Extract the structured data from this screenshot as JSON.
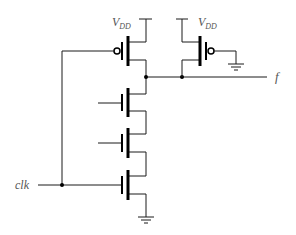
{
  "diagram": {
    "title": "",
    "type": "dynamic-logic-circuit",
    "labels": {
      "vdd_left": {
        "main": "V",
        "sub": "DD"
      },
      "vdd_right": {
        "main": "V",
        "sub": "DD"
      },
      "output": "f",
      "clock": "clk"
    },
    "components": [
      {
        "id": "pmos-precharge",
        "type": "PMOS",
        "gate": "clk"
      },
      {
        "id": "pmos-keeper",
        "type": "PMOS",
        "gate": "GND"
      },
      {
        "id": "nmos-input-1",
        "type": "NMOS",
        "gate": "input"
      },
      {
        "id": "nmos-input-2",
        "type": "NMOS",
        "gate": "input"
      },
      {
        "id": "nmos-evaluate",
        "type": "NMOS",
        "gate": "clk"
      }
    ],
    "colors": {
      "wire": "#1a1a1a",
      "label": "#555555",
      "background": "#ffffff"
    }
  }
}
